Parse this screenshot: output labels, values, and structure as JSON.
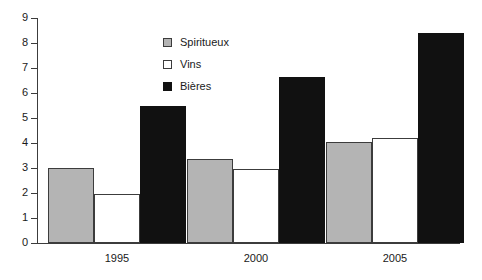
{
  "chart_data": {
    "type": "bar",
    "title": "",
    "subtitle": "",
    "xlabel": "",
    "ylabel": "",
    "categories": [
      "1995",
      "2000",
      "2005"
    ],
    "series": [
      {
        "name": "Spiritueux",
        "values": [
          3.0,
          3.35,
          4.05
        ],
        "color": "#b4b4b4"
      },
      {
        "name": "Vins",
        "values": [
          1.95,
          2.95,
          4.2
        ],
        "color": "#ffffff"
      },
      {
        "name": "Bières",
        "values": [
          5.5,
          6.65,
          8.4
        ],
        "color": "#111111"
      }
    ],
    "ylim": [
      0,
      9
    ],
    "yticks": [
      0,
      1,
      2,
      3,
      4,
      5,
      6,
      7,
      8,
      9
    ],
    "ytick_labels": [
      "0",
      "1",
      "2",
      "3",
      "4",
      "5",
      "6",
      "7",
      "8",
      "9"
    ],
    "grid": false,
    "legend_position": "top-center",
    "legend_entries": [
      "Spiritueux",
      "Vins",
      "Bières"
    ],
    "annotations": []
  },
  "axis": {
    "y_tick_labels": [
      "9",
      "8",
      "7",
      "6",
      "5",
      "4",
      "3",
      "2",
      "1",
      "0"
    ],
    "x_tick_labels": [
      "1995",
      "2000",
      "2005"
    ]
  },
  "legend": {
    "items": [
      {
        "label": "Spiritueux",
        "swatch": "spiritueux"
      },
      {
        "label": "Vins",
        "swatch": "vins"
      },
      {
        "label": "Bières",
        "swatch": "bieres"
      }
    ]
  },
  "colors": {
    "spiritueux": "#b4b4b4",
    "vins": "#ffffff",
    "bieres": "#111111",
    "axis": "#3c3c3c",
    "text": "#1a1a1a",
    "background": "#ffffff"
  }
}
